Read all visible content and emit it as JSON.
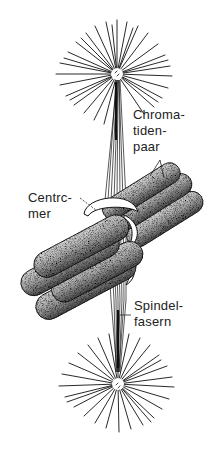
{
  "diagram": {
    "type": "biology-illustration",
    "labels": {
      "chromatiden_paar": [
        "Chroma-",
        "tiden-",
        "paar"
      ],
      "centromer": [
        "Centrc-",
        "mer"
      ],
      "spindelfasern": [
        "Spindel-",
        "fasern"
      ]
    },
    "colors": {
      "background": "#ffffff",
      "ink": "#111111",
      "chromatid_fill": "#9a9a9a",
      "chromatid_shadow": "#3a3a3a"
    },
    "parts": [
      "upper-aster",
      "lower-aster",
      "spindle-fibers",
      "chromatid-pair-back",
      "chromatid-pair-front",
      "centromere-rings"
    ]
  }
}
